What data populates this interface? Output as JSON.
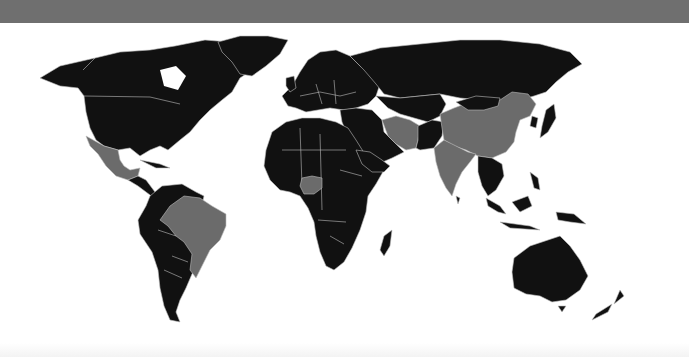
{
  "map": {
    "type": "world-choropleth",
    "projection": "equirectangular-like",
    "colors": {
      "header_band": "#6f6f6f",
      "background": "#ffffff",
      "base_country": "#111111",
      "highlighted_country": "#6b6b6b",
      "border": "#bdbdbd"
    },
    "highlighted_countries": [
      "Mexico",
      "Brazil",
      "Nigeria",
      "Iran",
      "India",
      "China"
    ],
    "legend": null,
    "title": null
  }
}
